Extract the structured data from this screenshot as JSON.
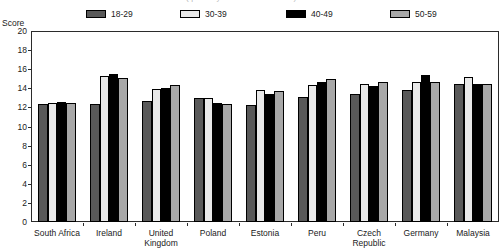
{
  "top_partial_text": {
    "ghost_line": "( partially cut-off header row )"
  },
  "axis": {
    "y_title": "Score",
    "y_ticks": [
      "20",
      "18",
      "16",
      "14",
      "12",
      "10",
      "8",
      "6",
      "4",
      "2",
      "0"
    ],
    "x_title": ""
  },
  "legend": {
    "items": [
      {
        "label": "18-29",
        "color": "#595959"
      },
      {
        "label": "30-39",
        "color": "#e9e9e9"
      },
      {
        "label": "40-49",
        "color": "#000000"
      },
      {
        "label": "50-59",
        "color": "#a8a8a8"
      }
    ]
  },
  "chart_data": {
    "type": "bar",
    "title": "",
    "subtitle": "",
    "xlabel": "",
    "ylabel": "Score",
    "ylim": [
      0,
      20
    ],
    "ytick_step": 2,
    "grid": false,
    "legend_position": "top",
    "categories": [
      "South Africa",
      "Ireland",
      "United\nKingdom",
      "Poland",
      "Estonia",
      "Peru",
      "Czech\nRepublic",
      "Germany",
      "Malaysia"
    ],
    "series": [
      {
        "name": "18-29",
        "color": "#595959",
        "values": [
          12.4,
          12.4,
          12.7,
          13.0,
          12.3,
          13.1,
          13.4,
          13.8,
          14.5
        ]
      },
      {
        "name": "30-39",
        "color": "#e9e9e9",
        "values": [
          12.5,
          15.3,
          13.9,
          13.0,
          13.8,
          14.3,
          14.5,
          14.7,
          15.2
        ]
      },
      {
        "name": "40-49",
        "color": "#000000",
        "values": [
          12.6,
          15.5,
          14.0,
          12.5,
          13.4,
          14.7,
          14.2,
          15.4,
          14.4
        ]
      },
      {
        "name": "50-59",
        "color": "#a8a8a8",
        "values": [
          12.5,
          15.1,
          14.3,
          12.4,
          13.7,
          15.0,
          14.7,
          14.7,
          14.4
        ]
      }
    ]
  }
}
